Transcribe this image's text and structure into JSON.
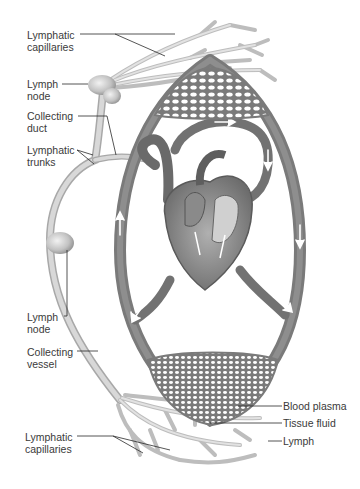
{
  "figure": {
    "type": "anatomical-illustration",
    "colors": {
      "background": "#ffffff",
      "blood_vessel": "#7a7a7a",
      "blood_vessel_dark": "#5e5e5e",
      "lymph_vessel": "#c9c9c9",
      "lymph_vessel_edge": "#a8a8a8",
      "label_text": "#3a3a3a",
      "leader_line": "#2a2a2a",
      "arrow": "#ffffff"
    }
  },
  "labels": {
    "left": [
      {
        "id": "lymphatic-capillaries-top",
        "text": "Lymphatic\ncapillaries"
      },
      {
        "id": "lymph-node-top",
        "text": "Lymph\nnode"
      },
      {
        "id": "collecting-duct",
        "text": "Collecting\nduct"
      },
      {
        "id": "lymphatic-trunks",
        "text": "Lymphatic\ntrunks"
      },
      {
        "id": "lymph-node-bottom",
        "text": "Lymph\nnode"
      },
      {
        "id": "collecting-vessel",
        "text": "Collecting\nvessel"
      },
      {
        "id": "lymphatic-capillaries-bottom",
        "text": "Lymphatic\ncapillaries"
      }
    ],
    "right": [
      {
        "id": "blood-plasma",
        "text": "Blood plasma"
      },
      {
        "id": "tissue-fluid",
        "text": "Tissue fluid"
      },
      {
        "id": "lymph",
        "text": "Lymph"
      }
    ]
  }
}
